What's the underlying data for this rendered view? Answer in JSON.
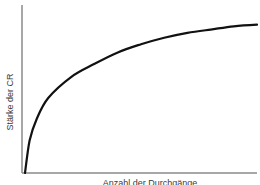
{
  "chart_data": {
    "type": "line",
    "title": "",
    "xlabel": "Anzahl der Durchgänge",
    "ylabel": "Stärke der CR",
    "grid": false,
    "legend": null,
    "xticks": [],
    "yticks": [],
    "xlim": [
      0,
      100
    ],
    "ylim": [
      0,
      100
    ],
    "series": [
      {
        "name": "Stärke der CR",
        "description": "Negatively accelerated learning curve (acquisition)",
        "x": [
          0,
          2,
          5,
          10,
          20,
          30,
          40,
          50,
          60,
          70,
          80,
          90,
          100
        ],
        "y": [
          0,
          20,
          33,
          46,
          59,
          67,
          74,
          79,
          83,
          86,
          88,
          90,
          91
        ]
      }
    ]
  },
  "colors": {
    "curve": "#111111",
    "axis": "#8a8a8a",
    "label": "#3a3a3a",
    "background": "#ffffff"
  }
}
